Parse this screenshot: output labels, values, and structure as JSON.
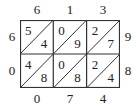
{
  "diagram": {
    "type": "lattice-multiplication",
    "multiplicand_digits": [
      "6",
      "1",
      "3"
    ],
    "multiplier_digits": [
      "9",
      "8"
    ],
    "rows": [
      {
        "cells": [
          {
            "tens": "5",
            "ones": "4"
          },
          {
            "tens": "0",
            "ones": "9"
          },
          {
            "tens": "2",
            "ones": "7"
          }
        ]
      },
      {
        "cells": [
          {
            "tens": "4",
            "ones": "8"
          },
          {
            "tens": "0",
            "ones": "8"
          },
          {
            "tens": "2",
            "ones": "4"
          }
        ]
      }
    ],
    "left_result_digits": [
      "6",
      "0"
    ],
    "bottom_result_digits": [
      "0",
      "7",
      "4"
    ]
  }
}
